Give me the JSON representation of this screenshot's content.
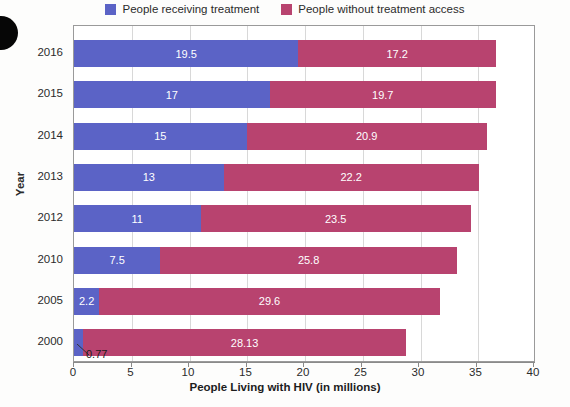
{
  "legend": {
    "items": [
      {
        "label": "People receiving treatment",
        "color": "#5B63C6"
      },
      {
        "label": "People without treatment access",
        "color": "#B8436F"
      }
    ]
  },
  "axes": {
    "x_title": "People Living with HIV (in millions)",
    "y_title": "Year",
    "x_ticks": [
      "0",
      "5",
      "10",
      "15",
      "20",
      "25",
      "30",
      "35",
      "40"
    ]
  },
  "callout": {
    "value_label": "0.77"
  },
  "chart_data": {
    "type": "bar",
    "orientation": "horizontal",
    "stacked": true,
    "title": "",
    "xlabel": "People Living with HIV (in millions)",
    "ylabel": "Year",
    "xlim": [
      0,
      40
    ],
    "xticks": [
      0,
      5,
      10,
      15,
      20,
      25,
      30,
      35,
      40
    ],
    "grid": true,
    "legend_position": "top-center",
    "categories": [
      "2016",
      "2015",
      "2014",
      "2013",
      "2012",
      "2010",
      "2005",
      "2000"
    ],
    "series": [
      {
        "name": "People receiving treatment",
        "color": "#5B63C6",
        "values": [
          19.5,
          17,
          15,
          13,
          11,
          7.5,
          2.2,
          0.77
        ],
        "value_labels": [
          "19.5",
          "17",
          "15",
          "13",
          "11",
          "7.5",
          "2.2",
          "0.77"
        ]
      },
      {
        "name": "People without treatment access",
        "color": "#B8436F",
        "values": [
          17.2,
          19.7,
          20.9,
          22.2,
          23.5,
          25.8,
          29.6,
          28.13
        ],
        "value_labels": [
          "17.2",
          "19.7",
          "20.9",
          "22.2",
          "23.5",
          "25.8",
          "29.6",
          "28.13"
        ]
      }
    ],
    "totals": [
      36.7,
      36.7,
      35.9,
      35.2,
      34.5,
      33.3,
      31.8,
      28.9
    ]
  }
}
